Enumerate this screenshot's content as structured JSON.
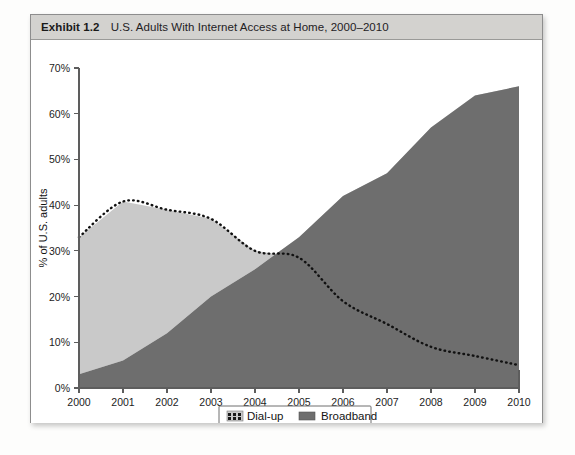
{
  "exhibit": {
    "label": "Exhibit 1.2",
    "title": "U.S. Adults With Internet Access at Home, 2000–2010"
  },
  "legend": {
    "dialup_label": "Dial-up",
    "broadband_label": "Broadband"
  },
  "colors": {
    "dialup_fill": "#c9c9c9",
    "broadband_fill": "#6e6e6e",
    "dialup_line": "#111111",
    "axis": "#5d5d5d",
    "header_bg": "#d3d2cf",
    "frame": "#8d8d8d"
  },
  "axes": {
    "y_label": "% of U.S. adults",
    "y_ticks": [
      "0%",
      "10%",
      "20%",
      "30%",
      "40%",
      "50%",
      "60%",
      "70%"
    ],
    "x_ticks": [
      "2000",
      "2001",
      "2002",
      "2003",
      "2004",
      "2005",
      "2006",
      "2007",
      "2008",
      "2009",
      "2010"
    ]
  },
  "chart_data": {
    "type": "area",
    "title": "U.S. Adults With Internet Access at Home, 2000–2010",
    "subtitle": "Exhibit 1.2",
    "xlabel": "",
    "ylabel": "% of U.S. adults",
    "stacked": true,
    "grid": false,
    "legend_position": "bottom",
    "xlim": [
      2000,
      2010
    ],
    "ylim": [
      0,
      70
    ],
    "ytick_values": [
      0,
      10,
      20,
      30,
      40,
      50,
      60,
      70
    ],
    "categories": [
      "2000",
      "2001",
      "2002",
      "2003",
      "2004",
      "2005",
      "2006",
      "2007",
      "2008",
      "2009",
      "2010"
    ],
    "x": [
      2000,
      2001,
      2002,
      2003,
      2004,
      2005,
      2006,
      2007,
      2008,
      2009,
      2010
    ],
    "series": [
      {
        "name": "Broadband",
        "type": "area",
        "color": "#6e6e6e",
        "values": [
          3,
          6,
          12,
          20,
          26,
          33,
          42,
          47,
          57,
          64,
          66
        ]
      },
      {
        "name": "Dial-up",
        "type": "area-with-dotted-top-line",
        "color": "#c9c9c9",
        "values": [
          30,
          35,
          27,
          17,
          4,
          0,
          0,
          0,
          0,
          0,
          0
        ],
        "top_line_values": [
          33,
          40.8,
          39,
          37,
          30,
          28.5,
          19,
          14,
          9,
          7,
          5
        ]
      }
    ],
    "annotations": []
  }
}
